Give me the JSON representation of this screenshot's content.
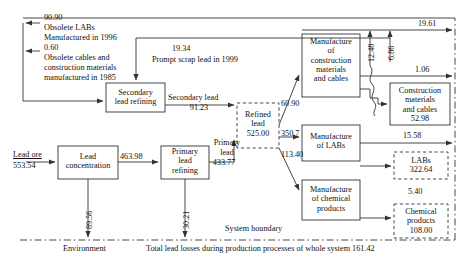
{
  "diagram": {
    "units": "kt",
    "system_boundary_label": "System boundary",
    "environment_label": "Environment",
    "total_losses_label": "Total lead losses during production processes of whole system 161.42"
  },
  "colors": {
    "line": "#333333",
    "box_border": "#333333",
    "text": "#111111",
    "background": "#ffffff"
  },
  "process_boxes": [
    {
      "id": "secondary-lead-refining",
      "lines": [
        "Secondary",
        "lead refining"
      ]
    },
    {
      "id": "lead-concentration",
      "lines": [
        "Lead",
        "concentration"
      ]
    },
    {
      "id": "primary-lead-refining",
      "lines": [
        "Primary",
        "lead",
        "refining"
      ]
    },
    {
      "id": "manufacture-construction-materials-cables",
      "lines": [
        "Manufacture",
        "of",
        "construction",
        "materials",
        "and cables"
      ]
    },
    {
      "id": "manufacture-labs",
      "lines": [
        "Manufacture",
        "of LABs"
      ]
    },
    {
      "id": "manufacture-chemical-products",
      "lines": [
        "Manufacture",
        "of chemical",
        "products"
      ]
    }
  ],
  "stock_boxes": [
    {
      "id": "refined-lead",
      "lines": [
        "Refined",
        "lead",
        "525.00"
      ],
      "style": "dashed"
    },
    {
      "id": "construction-materials-and-cables",
      "lines": [
        "Construction",
        "materials",
        "and cables",
        "52.98"
      ],
      "style": "solid"
    },
    {
      "id": "labs",
      "lines": [
        "LABs",
        "322.64"
      ],
      "style": "dashed"
    },
    {
      "id": "chemical-products",
      "lines": [
        "Chemical",
        "products",
        "108.00"
      ],
      "style": "dashed"
    }
  ],
  "inputs": {
    "obsolete_labs_value": "90.90",
    "obsolete_labs_text_1": "Obsolete LABs",
    "obsolete_labs_text_2": "Manufactured in 1996",
    "obsolete_cables_value": "0.60",
    "obsolete_cables_text_1": "Obsolete cables and",
    "obsolete_cables_text_2": "construction materials",
    "obsolete_cables_text_3": "manufactured in 1985",
    "prompt_scrap_value": "19.34",
    "prompt_scrap_text": "Prompt scrap lead in 1999",
    "lead_ore_label": "Lead ore",
    "lead_ore_value": "553.54"
  },
  "flows": {
    "secondary_lead_label": "Secondary lead",
    "secondary_lead_value": "91.23",
    "concentrate_value": "463.98",
    "primary_lead_label_1": "Primary",
    "primary_lead_label_2": "lead",
    "primary_lead_value": "433.77",
    "to_construction_value": "60.90",
    "to_labs_value": "350.7",
    "to_chemical_value": "113.40",
    "cm_loss_12_48": "12.48",
    "cm_loss_6_86": "6.86",
    "export_19_61": "19.61",
    "export_1_06": "1.06",
    "export_15_58": "15.58",
    "export_5_40": "5.40",
    "concentration_loss": "89.56",
    "primary_refining_loss": "30.21"
  }
}
